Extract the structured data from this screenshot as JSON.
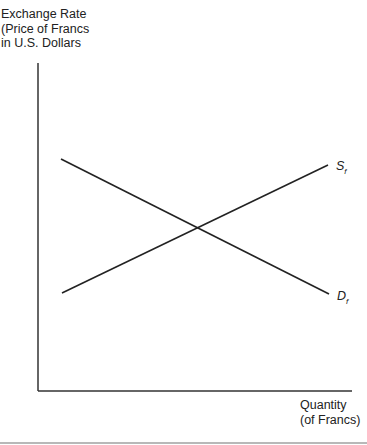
{
  "diagram": {
    "y_axis_label": "Exchange Rate\n(Price of Francs\nin U.S. Dollars",
    "x_axis_label": "Quantity\n(of Francs)",
    "supply_curve": {
      "label": "S",
      "subscript": "f",
      "from": [
        62,
        293
      ],
      "to": [
        328,
        165
      ]
    },
    "demand_curve": {
      "label": "D",
      "subscript": "f",
      "from": [
        61,
        159
      ],
      "to": [
        329,
        294
      ]
    },
    "intersection": [
      199,
      229
    ],
    "axes": {
      "origin": [
        38,
        391
      ],
      "y_top": 63,
      "x_right": 352
    },
    "line_color": "#222222"
  }
}
